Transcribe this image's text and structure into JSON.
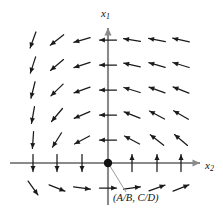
{
  "figure": {
    "name": "direction-field-phase-plane",
    "axis_color": "#8a8a8a",
    "arrow_color": "#1a1a1a",
    "background": "#ffffff",
    "labels": {
      "x1_base": "x",
      "x1_sub": "1",
      "x2_base": "x",
      "x2_sub": "2",
      "equilibrium_point": "(A/B, C/D)"
    }
  },
  "chart_data": {
    "type": "scatter",
    "title": "",
    "xlabel": "x2",
    "ylabel": "x1",
    "grid": false,
    "legend": null,
    "xlim": [
      10,
      200
    ],
    "ylim": [
      188,
      28
    ],
    "axes": {
      "vertical_axis_x": 108,
      "vertical_axis_top": 28,
      "vertical_axis_bottom": 205,
      "horizontal_axis_y": 163,
      "horizontal_axis_left": 10,
      "horizontal_axis_right": 200,
      "origin": [
        108,
        163
      ]
    },
    "equilibrium": {
      "x": 108,
      "y": 163,
      "radius": 4.2,
      "label": "(A/B, C/D)",
      "leader_line": [
        [
          110,
          166
        ],
        [
          126,
          192
        ]
      ]
    },
    "columns_x": [
      33,
      57,
      82,
      108,
      132,
      157,
      181
    ],
    "rows_y": [
      40,
      65,
      90,
      115,
      140,
      163,
      188
    ],
    "arrow_length": 17,
    "vectors": [
      {
        "x": 33,
        "y": 40,
        "angle": 250,
        "len": 17
      },
      {
        "x": 57,
        "y": 40,
        "angle": 218,
        "len": 17
      },
      {
        "x": 82,
        "y": 40,
        "angle": 196,
        "len": 17
      },
      {
        "x": 108,
        "y": 40,
        "angle": 180,
        "len": 17
      },
      {
        "x": 132,
        "y": 40,
        "angle": 171,
        "len": 17
      },
      {
        "x": 157,
        "y": 40,
        "angle": 169,
        "len": 17
      },
      {
        "x": 181,
        "y": 40,
        "angle": 168,
        "len": 17
      },
      {
        "x": 33,
        "y": 65,
        "angle": 252,
        "len": 17
      },
      {
        "x": 57,
        "y": 65,
        "angle": 220,
        "len": 17
      },
      {
        "x": 82,
        "y": 65,
        "angle": 198,
        "len": 17
      },
      {
        "x": 108,
        "y": 65,
        "angle": 180,
        "len": 17
      },
      {
        "x": 132,
        "y": 65,
        "angle": 167,
        "len": 17
      },
      {
        "x": 157,
        "y": 65,
        "angle": 164,
        "len": 17
      },
      {
        "x": 181,
        "y": 65,
        "angle": 163,
        "len": 17
      },
      {
        "x": 33,
        "y": 90,
        "angle": 256,
        "len": 17
      },
      {
        "x": 57,
        "y": 90,
        "angle": 224,
        "len": 17
      },
      {
        "x": 82,
        "y": 90,
        "angle": 200,
        "len": 17
      },
      {
        "x": 108,
        "y": 90,
        "angle": 180,
        "len": 17
      },
      {
        "x": 132,
        "y": 90,
        "angle": 163,
        "len": 17
      },
      {
        "x": 157,
        "y": 90,
        "angle": 160,
        "len": 17
      },
      {
        "x": 181,
        "y": 90,
        "angle": 159,
        "len": 17
      },
      {
        "x": 33,
        "y": 115,
        "angle": 260,
        "len": 17
      },
      {
        "x": 57,
        "y": 115,
        "angle": 230,
        "len": 17
      },
      {
        "x": 82,
        "y": 115,
        "angle": 203,
        "len": 17
      },
      {
        "x": 108,
        "y": 115,
        "angle": 180,
        "len": 17
      },
      {
        "x": 132,
        "y": 115,
        "angle": 158,
        "len": 17
      },
      {
        "x": 157,
        "y": 115,
        "angle": 152,
        "len": 17
      },
      {
        "x": 181,
        "y": 115,
        "angle": 150,
        "len": 17
      },
      {
        "x": 33,
        "y": 140,
        "angle": 266,
        "len": 17
      },
      {
        "x": 57,
        "y": 140,
        "angle": 238,
        "len": 17
      },
      {
        "x": 82,
        "y": 140,
        "angle": 208,
        "len": 17
      },
      {
        "x": 108,
        "y": 140,
        "angle": 180,
        "len": 17
      },
      {
        "x": 132,
        "y": 140,
        "angle": 152,
        "len": 17
      },
      {
        "x": 157,
        "y": 140,
        "angle": 142,
        "len": 17
      },
      {
        "x": 181,
        "y": 140,
        "angle": 140,
        "len": 17
      },
      {
        "x": 33,
        "y": 163,
        "angle": 270,
        "len": 17
      },
      {
        "x": 57,
        "y": 163,
        "angle": 270,
        "len": 17
      },
      {
        "x": 82,
        "y": 163,
        "angle": 270,
        "len": 17
      },
      {
        "x": 132,
        "y": 163,
        "angle": 90,
        "len": 17
      },
      {
        "x": 157,
        "y": 163,
        "angle": 90,
        "len": 17
      },
      {
        "x": 181,
        "y": 163,
        "angle": 90,
        "len": 17
      },
      {
        "x": 33,
        "y": 188,
        "angle": 305,
        "len": 17
      },
      {
        "x": 57,
        "y": 188,
        "angle": 338,
        "len": 17
      },
      {
        "x": 82,
        "y": 188,
        "angle": 352,
        "len": 17
      },
      {
        "x": 108,
        "y": 188,
        "angle": 0,
        "len": 17
      },
      {
        "x": 132,
        "y": 188,
        "angle": 8,
        "len": 17
      },
      {
        "x": 157,
        "y": 188,
        "angle": 20,
        "len": 17
      },
      {
        "x": 181,
        "y": 188,
        "angle": 22,
        "len": 17
      }
    ]
  }
}
